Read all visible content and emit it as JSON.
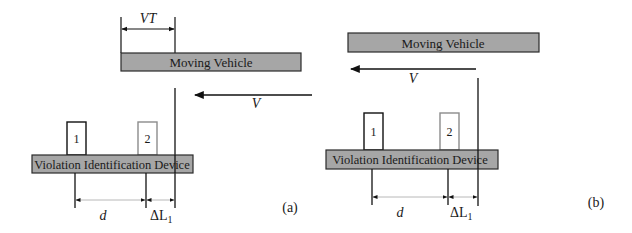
{
  "figure": {
    "colors": {
      "box_fill": "#a6a6a6",
      "box_stroke": "#2a2a2a",
      "line": "#111111",
      "sensor_1_stroke": "#111111",
      "sensor_2_stroke": "#8c8c8c",
      "dimension_line": "#b8b8b8"
    },
    "panels": [
      {
        "id": "a",
        "caption": "(a)",
        "vehicle_label": "Moving Vehicle",
        "device_label": "Violation Identification Device",
        "sensor_labels": [
          "1",
          "2"
        ],
        "velocity_label": "V",
        "vt_label": "VT",
        "d_label": "d",
        "delta_label": "ΔL",
        "delta_sub": "1"
      },
      {
        "id": "b",
        "caption": "(b)",
        "vehicle_label": "Moving Vehicle",
        "device_label": "Violation Identification Device",
        "sensor_labels": [
          "1",
          "2"
        ],
        "velocity_label": "V",
        "d_label": "d",
        "delta_label": "ΔL",
        "delta_sub": "1"
      }
    ]
  }
}
